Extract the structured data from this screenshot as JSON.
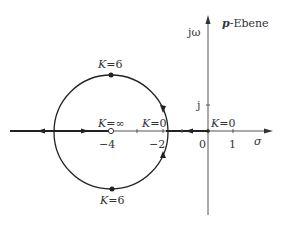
{
  "diagram": {
    "title": "p-Ebene",
    "title_italic_part": "p",
    "title_rest": "-Ebene",
    "axes": {
      "x_label": "σ",
      "y_label": "jω",
      "y_tick_label": "j",
      "x_ticks": [
        {
          "value": -4,
          "label": "−4"
        },
        {
          "value": -2,
          "label": "−2"
        },
        {
          "value": 0,
          "label": "0"
        },
        {
          "value": 1,
          "label": "1"
        }
      ]
    },
    "labels": {
      "k_top": "K=6",
      "k_bottom": "K=6",
      "k_inf": "K=∞",
      "k_zero_left": "K=0",
      "k_zero_origin": "K=0"
    },
    "colors": {
      "line": "#333333",
      "axis": "#555555"
    }
  }
}
